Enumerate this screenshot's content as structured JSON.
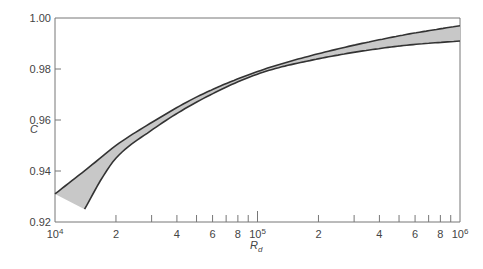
{
  "chart_data": {
    "type": "area",
    "title": "",
    "xlabel": "R_d",
    "ylabel": "C",
    "xscale": "log",
    "xlim": [
      10000,
      1000000
    ],
    "ylim": [
      0.92,
      1.0
    ],
    "grid": false,
    "legend": null,
    "y_ticks": [
      {
        "value": 0.92,
        "label": "0.92"
      },
      {
        "value": 0.94,
        "label": "0.94"
      },
      {
        "value": 0.96,
        "label": "0.96"
      },
      {
        "value": 0.98,
        "label": "0.98"
      },
      {
        "value": 1.0,
        "label": "1.00"
      }
    ],
    "x_ticks": [
      {
        "value": 10000,
        "label": "10",
        "sup": "4"
      },
      {
        "value": 20000,
        "label": "2"
      },
      {
        "value": 30000,
        "label": ""
      },
      {
        "value": 40000,
        "label": "4"
      },
      {
        "value": 50000,
        "label": ""
      },
      {
        "value": 60000,
        "label": "6"
      },
      {
        "value": 70000,
        "label": ""
      },
      {
        "value": 80000,
        "label": "8"
      },
      {
        "value": 90000,
        "label": ""
      },
      {
        "value": 100000,
        "label": "10",
        "sup": "5"
      },
      {
        "value": 200000,
        "label": "2"
      },
      {
        "value": 300000,
        "label": ""
      },
      {
        "value": 400000,
        "label": "4"
      },
      {
        "value": 500000,
        "label": ""
      },
      {
        "value": 600000,
        "label": "6"
      },
      {
        "value": 700000,
        "label": ""
      },
      {
        "value": 800000,
        "label": "8"
      },
      {
        "value": 900000,
        "label": ""
      },
      {
        "value": 1000000,
        "label": "10",
        "sup": "6"
      }
    ],
    "series": [
      {
        "name": "upper bound",
        "x": [
          10000,
          15000,
          20000,
          30000,
          50000,
          100000,
          200000,
          500000,
          1000000
        ],
        "y": [
          0.931,
          0.942,
          0.95,
          0.959,
          0.969,
          0.979,
          0.986,
          0.993,
          0.997
        ]
      },
      {
        "name": "lower bound",
        "x": [
          14000,
          17000,
          20000,
          30000,
          50000,
          100000,
          200000,
          500000,
          1000000
        ],
        "y": [
          0.925,
          0.937,
          0.945,
          0.956,
          0.967,
          0.978,
          0.984,
          0.989,
          0.991
        ]
      }
    ],
    "fill_between": {
      "color": "#c8c8c8",
      "stroke": "#333333"
    }
  }
}
